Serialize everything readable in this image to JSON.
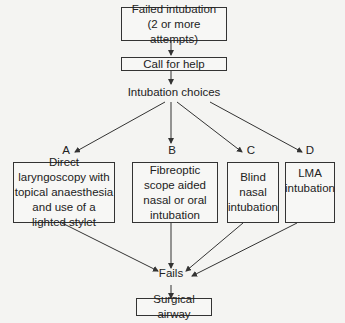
{
  "diagram": {
    "start": "Failed intubation\n(2 or more attempts)",
    "start_line1": "Failed intubation",
    "start_line2": "(2 or more attempts)",
    "help": "Call for help",
    "choices": "Intubation choices",
    "options": [
      {
        "letter": "A",
        "text": "Direct laryngoscopy with topical anaesthesia and use of a lighted stylet"
      },
      {
        "letter": "B",
        "text": "Fibreoptic scope aided nasal or oral intubation"
      },
      {
        "letter": "C",
        "text": "Blind nasal intubation"
      },
      {
        "letter": "D",
        "text": "LMA intubation"
      }
    ],
    "fails": "Fails",
    "end": "Surgical airway"
  },
  "colors": {
    "line": "#333333",
    "background": "#f4f4f2"
  }
}
